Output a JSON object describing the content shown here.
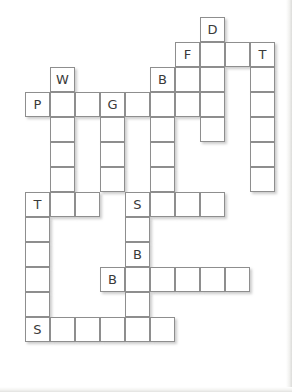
{
  "puzzle": {
    "type": "crossword-grid",
    "title": "",
    "cell_size_px": 25,
    "origin": {
      "x": 25,
      "y": 17
    },
    "columns": 10,
    "rows": 13,
    "colors": {
      "cell_background": "#ffffff",
      "cell_border": "#8e8e8e",
      "letter": "#3a3a3a",
      "page_background": "#ffffff",
      "shadow": "rgba(120,120,120,0.38)"
    },
    "letters_present": [
      "D",
      "F",
      "T",
      "W",
      "B",
      "P",
      "G",
      "T",
      "S",
      "B",
      "B",
      "S"
    ],
    "cells": [
      {
        "row": 0,
        "col": 7,
        "letter": "D"
      },
      {
        "row": 1,
        "col": 6,
        "letter": "F"
      },
      {
        "row": 1,
        "col": 7,
        "letter": ""
      },
      {
        "row": 1,
        "col": 8,
        "letter": ""
      },
      {
        "row": 1,
        "col": 9,
        "letter": "T"
      },
      {
        "row": 2,
        "col": 1,
        "letter": "W"
      },
      {
        "row": 2,
        "col": 5,
        "letter": "B"
      },
      {
        "row": 2,
        "col": 6,
        "letter": ""
      },
      {
        "row": 2,
        "col": 7,
        "letter": ""
      },
      {
        "row": 2,
        "col": 9,
        "letter": ""
      },
      {
        "row": 3,
        "col": 0,
        "letter": "P"
      },
      {
        "row": 3,
        "col": 1,
        "letter": ""
      },
      {
        "row": 3,
        "col": 2,
        "letter": ""
      },
      {
        "row": 3,
        "col": 3,
        "letter": "G"
      },
      {
        "row": 3,
        "col": 4,
        "letter": ""
      },
      {
        "row": 3,
        "col": 5,
        "letter": ""
      },
      {
        "row": 3,
        "col": 6,
        "letter": ""
      },
      {
        "row": 3,
        "col": 7,
        "letter": ""
      },
      {
        "row": 3,
        "col": 9,
        "letter": ""
      },
      {
        "row": 4,
        "col": 1,
        "letter": ""
      },
      {
        "row": 4,
        "col": 3,
        "letter": ""
      },
      {
        "row": 4,
        "col": 5,
        "letter": ""
      },
      {
        "row": 4,
        "col": 7,
        "letter": ""
      },
      {
        "row": 4,
        "col": 9,
        "letter": ""
      },
      {
        "row": 5,
        "col": 1,
        "letter": ""
      },
      {
        "row": 5,
        "col": 3,
        "letter": ""
      },
      {
        "row": 5,
        "col": 5,
        "letter": ""
      },
      {
        "row": 5,
        "col": 9,
        "letter": ""
      },
      {
        "row": 6,
        "col": 1,
        "letter": ""
      },
      {
        "row": 6,
        "col": 3,
        "letter": ""
      },
      {
        "row": 6,
        "col": 5,
        "letter": ""
      },
      {
        "row": 6,
        "col": 9,
        "letter": ""
      },
      {
        "row": 7,
        "col": 0,
        "letter": "T"
      },
      {
        "row": 7,
        "col": 1,
        "letter": ""
      },
      {
        "row": 7,
        "col": 2,
        "letter": ""
      },
      {
        "row": 7,
        "col": 4,
        "letter": "S"
      },
      {
        "row": 7,
        "col": 5,
        "letter": ""
      },
      {
        "row": 7,
        "col": 6,
        "letter": ""
      },
      {
        "row": 7,
        "col": 7,
        "letter": ""
      },
      {
        "row": 8,
        "col": 0,
        "letter": ""
      },
      {
        "row": 8,
        "col": 4,
        "letter": ""
      },
      {
        "row": 9,
        "col": 0,
        "letter": ""
      },
      {
        "row": 9,
        "col": 4,
        "letter": "B"
      },
      {
        "row": 10,
        "col": 0,
        "letter": ""
      },
      {
        "row": 10,
        "col": 3,
        "letter": "B"
      },
      {
        "row": 10,
        "col": 4,
        "letter": ""
      },
      {
        "row": 10,
        "col": 5,
        "letter": ""
      },
      {
        "row": 10,
        "col": 6,
        "letter": ""
      },
      {
        "row": 10,
        "col": 7,
        "letter": ""
      },
      {
        "row": 10,
        "col": 8,
        "letter": ""
      },
      {
        "row": 11,
        "col": 0,
        "letter": ""
      },
      {
        "row": 11,
        "col": 4,
        "letter": ""
      },
      {
        "row": 12,
        "col": 0,
        "letter": "S"
      },
      {
        "row": 12,
        "col": 1,
        "letter": ""
      },
      {
        "row": 12,
        "col": 2,
        "letter": ""
      },
      {
        "row": 12,
        "col": 3,
        "letter": ""
      },
      {
        "row": 12,
        "col": 4,
        "letter": ""
      },
      {
        "row": 12,
        "col": 5,
        "letter": ""
      }
    ]
  }
}
